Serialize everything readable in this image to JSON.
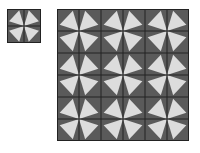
{
  "colors": {
    "background": "#ffffff",
    "cell_fill": "#5a5a5a",
    "triangle_fill": "#dcdcdc",
    "grid_line": "#222222"
  },
  "small_tile": {
    "x": 7,
    "y": 9,
    "size": 34,
    "rows": 2,
    "cols": 2,
    "pinwheel_centers": [
      [
        1,
        1
      ]
    ]
  },
  "big_grid": {
    "x": 57,
    "y": 9,
    "size": 132,
    "rows": 6,
    "cols": 6,
    "pinwheel_centers": [
      [
        1,
        1
      ],
      [
        1,
        3
      ],
      [
        1,
        5
      ],
      [
        3,
        1
      ],
      [
        3,
        3
      ],
      [
        3,
        5
      ],
      [
        5,
        1
      ],
      [
        5,
        3
      ],
      [
        5,
        5
      ]
    ]
  },
  "triangle_shape": {
    "description": "apex at inner corner facing pinwheel center; base vertices near opposite edges",
    "base_a": [
      0.12,
      0.72
    ],
    "base_b": [
      0.72,
      0.08
    ]
  }
}
